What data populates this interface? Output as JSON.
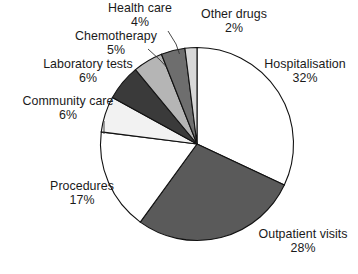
{
  "chart_data": {
    "type": "pie",
    "title": "",
    "subtitle": "",
    "xlabel": "",
    "ylabel": "",
    "legend_position": "none",
    "grid": false,
    "units": "percent",
    "start_angle_deg": 0,
    "direction": "clockwise",
    "total": 100,
    "categories": [
      "Hospitalisation",
      "Outpatient visits",
      "Procedures",
      "Community care",
      "Laboratory tests",
      "Chemotherapy",
      "Health care",
      "Other drugs"
    ],
    "values": [
      32,
      28,
      17,
      6,
      6,
      5,
      4,
      2
    ],
    "slices": [
      {
        "label": "Hospitalisation",
        "value": 32,
        "pct_text": "32%",
        "color": "#ffffff",
        "start_deg": 0,
        "end_deg": 115.2
      },
      {
        "label": "Outpatient visits",
        "value": 28,
        "pct_text": "28%",
        "color": "#5a5a5a",
        "start_deg": 115.2,
        "end_deg": 216.0
      },
      {
        "label": "Procedures",
        "value": 17,
        "pct_text": "17%",
        "color": "#ffffff",
        "start_deg": 216.0,
        "end_deg": 277.2
      },
      {
        "label": "Community care",
        "value": 6,
        "pct_text": "6%",
        "color": "#f2f2f2",
        "start_deg": 277.2,
        "end_deg": 298.8
      },
      {
        "label": "Laboratory tests",
        "value": 6,
        "pct_text": "6%",
        "color": "#3a3a3a",
        "start_deg": 298.8,
        "end_deg": 320.4
      },
      {
        "label": "Chemotherapy",
        "value": 5,
        "pct_text": "5%",
        "color": "#b5b5b5",
        "start_deg": 320.4,
        "end_deg": 338.4
      },
      {
        "label": "Health care",
        "value": 4,
        "pct_text": "4%",
        "color": "#6e6e6e",
        "start_deg": 338.4,
        "end_deg": 352.8
      },
      {
        "label": "Other drugs",
        "value": 2,
        "pct_text": "2%",
        "color": "#d8d8d8",
        "start_deg": 352.8,
        "end_deg": 360.0
      }
    ]
  },
  "labels": {
    "hospitalisation": {
      "name": "Hospitalisation",
      "pct": "32%"
    },
    "outpatient_visits": {
      "name": "Outpatient visits",
      "pct": "28%"
    },
    "procedures": {
      "name": "Procedures",
      "pct": "17%"
    },
    "community_care": {
      "name": "Community care",
      "pct": "6%"
    },
    "laboratory_tests": {
      "name": "Laboratory tests",
      "pct": "6%"
    },
    "chemotherapy": {
      "name": "Chemotherapy",
      "pct": "5%"
    },
    "health_care": {
      "name": "Health care",
      "pct": "4%"
    },
    "other_drugs": {
      "name": "Other drugs",
      "pct": "2%"
    }
  },
  "geometry": {
    "cx": 197,
    "cy": 144,
    "r": 96.5
  },
  "colors": {
    "background": "#ffffff",
    "outline": "#111111",
    "text": "#1a1a1a",
    "leader": "#333333"
  }
}
